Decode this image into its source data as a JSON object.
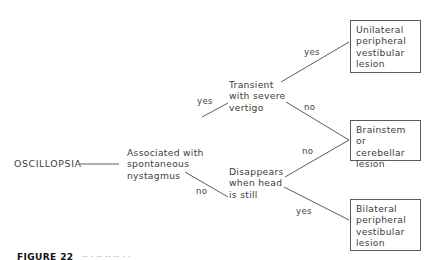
{
  "diagram": {
    "type": "decision-tree",
    "root": "OSCILLOPSIA",
    "nodes": {
      "q1": [
        "Associated with",
        "spontaneous",
        "nystagmus"
      ],
      "q2": [
        "Transient",
        "with severe",
        "vertigo"
      ],
      "q3": [
        "Disappears",
        "when head",
        "is still"
      ]
    },
    "outcomes": {
      "unilateral": [
        "Unilateral",
        "peripheral",
        "vestibular",
        "lesion"
      ],
      "central": [
        "Brainstem",
        "or cerebellar",
        "lesion"
      ],
      "bilateral": [
        "Bilateral",
        "peripheral",
        "vestibular",
        "lesion"
      ]
    },
    "edge_labels": {
      "q1_yes": "yes",
      "q1_no": "no",
      "q2_yes": "yes",
      "q2_no": "no",
      "q3_no": "no",
      "q3_yes": "yes"
    },
    "edges": [
      {
        "from": "OSCILLOPSIA",
        "to": "q1",
        "label": ""
      },
      {
        "from": "q1",
        "to": "q2",
        "label": "yes"
      },
      {
        "from": "q1",
        "to": "q3",
        "label": "no"
      },
      {
        "from": "q2",
        "to": "unilateral",
        "label": "yes"
      },
      {
        "from": "q2",
        "to": "central",
        "label": "no"
      },
      {
        "from": "q3",
        "to": "central",
        "label": "no"
      },
      {
        "from": "q3",
        "to": "bilateral",
        "label": "yes"
      }
    ]
  },
  "caption": {
    "figure_label": "FIGURE 22",
    "text_truncated": "Analysis of oscillopsia (caption cut off)"
  },
  "colors": {
    "line": "#4a4a4a",
    "text": "#3d3d3d",
    "background": "#ffffff"
  }
}
